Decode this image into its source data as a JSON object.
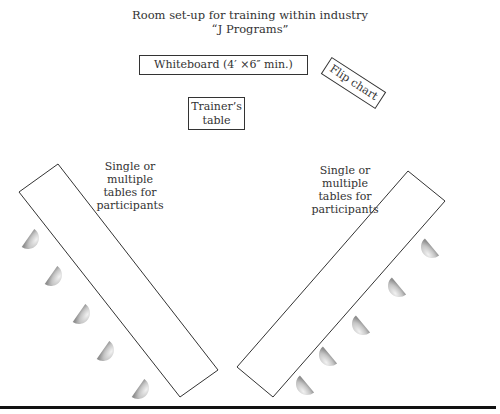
{
  "title": {
    "line1": "Room set-up for training within industry",
    "line2": "“J Programs”"
  },
  "elements": {
    "whiteboard": "Whiteboard (4′ ×6″ min.)",
    "flip_chart": "Flip chart",
    "trainer_table_line1": "Trainer’s",
    "trainer_table_line2": "table",
    "left_tables_label": [
      "Single or",
      "multiple",
      "tables for",
      "participants"
    ],
    "right_tables_label": [
      "Single or",
      "multiple",
      "tables for",
      "participants"
    ]
  },
  "seats": {
    "trainer_chair": 1,
    "left_side_chairs": 5,
    "right_side_chairs": 5
  },
  "colors": {
    "line": "#333333",
    "chair_light": "#e6e6e6",
    "chair_dark": "#9a9a9a",
    "floor": "#111111"
  }
}
